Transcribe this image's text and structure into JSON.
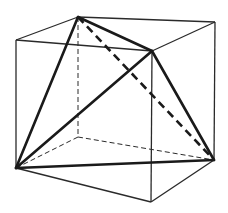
{
  "figure": {
    "cube": {
      "vertices": [
        "front-top-left",
        "front-top-right",
        "front-bottom-right",
        "front-bottom-left",
        "back-top-left",
        "back-top-right",
        "back-bottom-right",
        "back-bottom-left"
      ],
      "visible_edges": [
        [
          "front-top-left",
          "front-top-right"
        ],
        [
          "front-top-right",
          "front-bottom-right"
        ],
        [
          "front-bottom-right",
          "front-bottom-left"
        ],
        [
          "front-bottom-left",
          "front-top-left"
        ],
        [
          "front-top-left",
          "back-top-left"
        ],
        [
          "back-top-left",
          "back-top-right"
        ],
        [
          "back-top-right",
          "front-top-right"
        ],
        [
          "back-top-right",
          "back-bottom-right"
        ],
        [
          "back-bottom-right",
          "front-bottom-right"
        ]
      ],
      "hidden_edges": [
        [
          "back-top-left",
          "back-bottom-left"
        ],
        [
          "back-bottom-left",
          "front-bottom-left"
        ],
        [
          "back-bottom-left",
          "back-bottom-right"
        ]
      ]
    },
    "tetrahedron": {
      "vertices": [
        "back-top-left",
        "front-top-right",
        "front-bottom-left",
        "back-bottom-right"
      ],
      "visible_edges": [
        [
          "back-top-left",
          "front-top-right"
        ],
        [
          "back-top-left",
          "front-bottom-left"
        ],
        [
          "front-top-right",
          "front-bottom-left"
        ],
        [
          "front-top-right",
          "back-bottom-right"
        ],
        [
          "front-bottom-left",
          "back-bottom-right"
        ]
      ],
      "hidden_edges": [
        [
          "back-top-left",
          "back-bottom-right"
        ]
      ]
    },
    "colors": {
      "line": "#1a1a1a",
      "background": "#ffffff"
    }
  }
}
